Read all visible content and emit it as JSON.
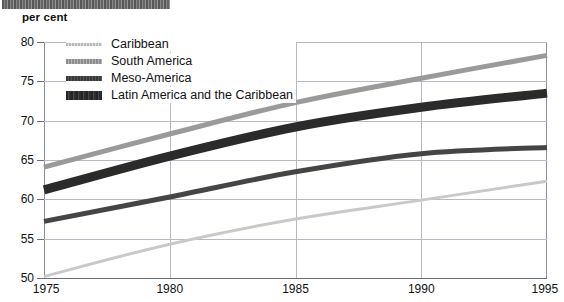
{
  "header": {
    "unit_label": "per cent",
    "scan_artifact": "scan-bar"
  },
  "legend": {
    "position": "top-left-inside",
    "entries": [
      {
        "label": "Caribbean",
        "key": "caribbean",
        "swatch": "line-light-thin",
        "color": "#c9c9c9"
      },
      {
        "label": "South America",
        "key": "south_america",
        "swatch": "line-gray-medium",
        "color": "#9a9a9a"
      },
      {
        "label": "Meso-America",
        "key": "meso_america",
        "swatch": "line-dark-thin",
        "color": "#454545"
      },
      {
        "label": "Latin America and the Caribbean",
        "key": "latin_america",
        "swatch": "line-black-thick",
        "color": "#2b2b2b"
      }
    ]
  },
  "axes": {
    "y_ticks": [
      "80",
      "75",
      "70",
      "65",
      "60",
      "55",
      "50"
    ],
    "x_ticks": [
      "1975",
      "1980",
      "1985",
      "1990",
      "1995"
    ]
  },
  "chart_data": {
    "type": "line",
    "title": "",
    "subtitle": "",
    "xlabel": "",
    "ylabel": "per cent",
    "xlim": [
      1975,
      1995
    ],
    "ylim": [
      50,
      80
    ],
    "yticks": [
      50,
      55,
      60,
      65,
      70,
      75,
      80
    ],
    "xticks": [
      1975,
      1980,
      1985,
      1990,
      1995
    ],
    "grid": true,
    "legend_position": "upper left",
    "x": [
      1975,
      1980,
      1985,
      1990,
      1995
    ],
    "series": [
      {
        "name": "Caribbean",
        "color": "#c9c9c9",
        "width": 3,
        "values": [
          50.2,
          54.3,
          57.5,
          59.9,
          62.3
        ]
      },
      {
        "name": "South America",
        "color": "#9a9a9a",
        "width": 5,
        "values": [
          64.1,
          68.3,
          72.3,
          75.4,
          78.3
        ]
      },
      {
        "name": "Meso-America",
        "color": "#454545",
        "width": 5,
        "values": [
          57.2,
          60.3,
          63.5,
          65.8,
          66.6
        ]
      },
      {
        "name": "Latin America and the Caribbean",
        "color": "#2b2b2b",
        "width": 9,
        "values": [
          61.2,
          65.5,
          69.2,
          71.7,
          73.5
        ]
      }
    ]
  }
}
